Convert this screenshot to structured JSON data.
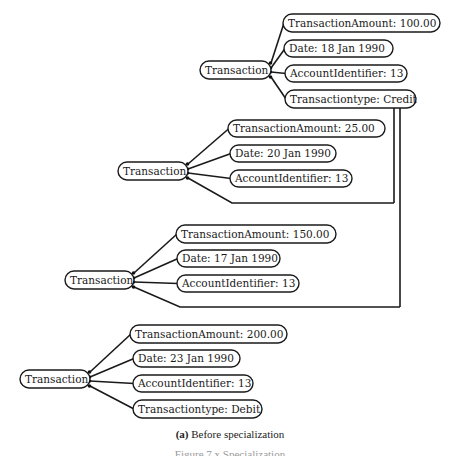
{
  "diagram": {
    "trees": [
      {
        "id": "tree-1",
        "parent": {
          "label": "Transaction",
          "x": 200,
          "y": 61,
          "w": 71,
          "h": 18
        },
        "children": [
          {
            "label": "TransactionAmount: 100.00",
            "x": 283,
            "y": 14,
            "w": 157,
            "h": 18
          },
          {
            "label": "Date: 18 Jan 1990",
            "x": 284,
            "y": 40,
            "w": 109,
            "h": 17
          },
          {
            "label": "AccountIdentifier: 13",
            "x": 285,
            "y": 65,
            "w": 122,
            "h": 17
          },
          {
            "label": "Transactiontype: Credit",
            "x": 285,
            "y": 90,
            "w": 131,
            "h": 18
          }
        ]
      },
      {
        "id": "tree-2",
        "parent": {
          "label": "Transaction",
          "x": 118,
          "y": 162,
          "w": 70,
          "h": 18
        },
        "children": [
          {
            "label": "TransactionAmount: 25.00",
            "x": 228,
            "y": 120,
            "w": 157,
            "h": 17
          },
          {
            "label": "Date: 20 Jan 1990",
            "x": 230,
            "y": 145,
            "w": 106,
            "h": 17
          },
          {
            "label": "AccountIdentifier: 13",
            "x": 230,
            "y": 170,
            "w": 122,
            "h": 17
          }
        ],
        "shared_link_y": 203
      },
      {
        "id": "tree-3",
        "parent": {
          "label": "Transaction",
          "x": 65,
          "y": 271,
          "w": 69,
          "h": 18
        },
        "children": [
          {
            "label": "TransactionAmount: 150.00",
            "x": 176,
            "y": 225,
            "w": 160,
            "h": 18
          },
          {
            "label": "Date: 17 Jan 1990",
            "x": 177,
            "y": 250,
            "w": 103,
            "h": 17
          },
          {
            "label": "AccountIdentifier: 13",
            "x": 177,
            "y": 275,
            "w": 122,
            "h": 17
          }
        ],
        "shared_link_y": 307
      },
      {
        "id": "tree-4",
        "parent": {
          "label": "Transaction",
          "x": 20,
          "y": 370,
          "w": 70,
          "h": 18
        },
        "children": [
          {
            "label": "TransactionAmount: 200.00",
            "x": 130,
            "y": 325,
            "w": 157,
            "h": 18
          },
          {
            "label": "Date: 23 Jan 1990",
            "x": 133,
            "y": 350,
            "w": 107,
            "h": 17
          },
          {
            "label": "AccountIdentifier: 13",
            "x": 133,
            "y": 375,
            "w": 120,
            "h": 17
          },
          {
            "label": "Transactiontype: Debit",
            "x": 133,
            "y": 400,
            "w": 129,
            "h": 18
          }
        ]
      }
    ],
    "shared_connectors": [
      {
        "from_node": "Transactiontype: Credit",
        "drop_x": 394,
        "to_y": 203,
        "to_tree": "tree-2"
      },
      {
        "from_node": "Transactiontype: Credit",
        "drop_x": 400,
        "to_y": 307,
        "to_tree": "tree-3"
      }
    ],
    "colors": {
      "stroke": "#1a1a1a",
      "background": "#ffffff"
    }
  },
  "caption": {
    "sub_label": "(a)",
    "sub_text": "Before specialization",
    "figure_text": "Figure 7.x  Specialization"
  }
}
